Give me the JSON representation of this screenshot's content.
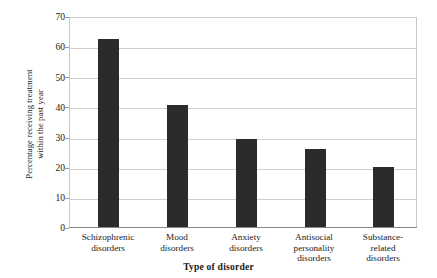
{
  "chart_data": {
    "type": "bar",
    "title": "",
    "categories": [
      "Schizophrenic disorders",
      "Mood disorders",
      "Anxiety disorders",
      "Antisocial personality disorders",
      "Substance-related disorders"
    ],
    "category_lines": [
      [
        "Schizophrenic",
        "disorders"
      ],
      [
        "Mood",
        "disorders"
      ],
      [
        "Anxiety",
        "disorders"
      ],
      [
        "Antisocial",
        "personality",
        "disorders"
      ],
      [
        "Substance-",
        "related",
        "disorders"
      ]
    ],
    "values": [
      63,
      41,
      29.5,
      26,
      20
    ],
    "xlabel": "Type of disorder",
    "ylabel": "Percentage receiving treatment within the past year",
    "ylabel_lines": [
      "Percentage receiving treatment",
      "within the past year"
    ],
    "ylim": [
      0,
      70
    ],
    "ytick_values": [
      70,
      60,
      50,
      40,
      30,
      20,
      10,
      0
    ],
    "ytick_labels": [
      "70",
      "60",
      "50",
      "40",
      "30",
      "20",
      "10",
      "0"
    ],
    "grid": true,
    "legend": "none",
    "bar_color": "#2b2b2b",
    "grid_color": "#cfcfcf",
    "frame_color": "#c8c8c8",
    "background_color": "#ffffff"
  }
}
